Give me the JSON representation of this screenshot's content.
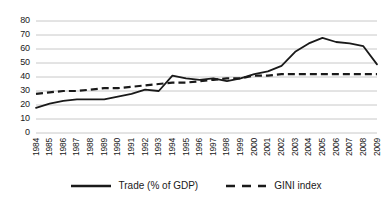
{
  "chart_data": {
    "type": "line",
    "title": "",
    "xlabel": "",
    "ylabel": "",
    "ylim": [
      0,
      80
    ],
    "ytick_step": 10,
    "grid": true,
    "legend_position": "bottom",
    "categories": [
      "1984",
      "1985",
      "1986",
      "1987",
      "1988",
      "1989",
      "1990",
      "1991",
      "1992",
      "1993",
      "1994",
      "1995",
      "1996",
      "1997",
      "1998",
      "1999",
      "2000",
      "2001",
      "2002",
      "2003",
      "2004",
      "2005",
      "2006",
      "2007",
      "2008",
      "2009"
    ],
    "yticks": [
      "0",
      "10",
      "20",
      "30",
      "40",
      "50",
      "60",
      "70",
      "80"
    ],
    "series": [
      {
        "name": "Trade (% of GDP)",
        "style": "solid",
        "color": "#1a1a1a",
        "values": [
          18,
          21,
          23,
          24,
          24,
          24,
          26,
          28,
          31,
          30,
          41,
          39,
          38,
          39,
          37,
          39,
          42,
          44,
          48,
          58,
          64,
          68,
          65,
          64,
          62,
          49
        ]
      },
      {
        "name": "GINI index",
        "style": "dashed",
        "color": "#1a1a1a",
        "values": [
          28,
          29,
          30,
          30,
          31,
          32,
          32,
          33,
          34,
          35,
          36,
          36,
          37,
          38,
          39,
          39,
          41,
          41,
          42,
          42,
          42,
          42,
          42,
          42,
          42,
          42
        ]
      }
    ]
  },
  "legend": {
    "items": [
      {
        "label": "Trade (% of GDP)",
        "icon": "solid-line-swatch"
      },
      {
        "label": "GINI index",
        "icon": "dashed-line-swatch"
      }
    ]
  },
  "colors": {
    "line": "#1a1a1a",
    "grid": "#c8c8c8",
    "background": "#ffffff",
    "text": "#1a1a1a"
  }
}
